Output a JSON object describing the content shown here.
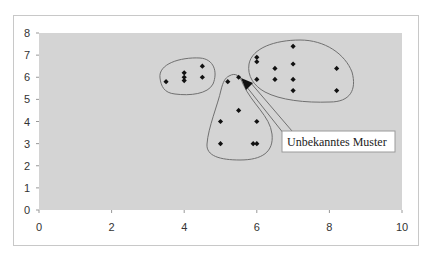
{
  "chart_data": {
    "type": "scatter",
    "title": "",
    "xlabel": "",
    "ylabel": "",
    "xlim": [
      0,
      10
    ],
    "ylim": [
      0,
      8
    ],
    "x_ticks": [
      0,
      2,
      4,
      6,
      8,
      10
    ],
    "y_ticks": [
      0,
      1,
      2,
      3,
      4,
      5,
      6,
      7,
      8
    ],
    "grid": false,
    "legend": null,
    "plot_background": "#d4d4d4",
    "marker": "diamond",
    "marker_color": "#111111",
    "series": [
      {
        "name": "Cluster left",
        "points": [
          [
            3.5,
            5.8
          ],
          [
            4.0,
            6.2
          ],
          [
            4.0,
            6.0
          ],
          [
            4.0,
            5.85
          ],
          [
            4.5,
            6.5
          ],
          [
            4.5,
            6.0
          ]
        ]
      },
      {
        "name": "Cluster middle",
        "points": [
          [
            5.2,
            5.8
          ],
          [
            5.5,
            6.0
          ],
          [
            5.5,
            4.5
          ],
          [
            5.0,
            4.0
          ],
          [
            6.0,
            4.0
          ],
          [
            5.0,
            3.0
          ],
          [
            5.9,
            3.0
          ],
          [
            6.0,
            3.0
          ]
        ]
      },
      {
        "name": "Cluster right",
        "points": [
          [
            6.0,
            6.9
          ],
          [
            6.0,
            6.7
          ],
          [
            7.0,
            7.4
          ],
          [
            6.5,
            6.4
          ],
          [
            7.0,
            6.6
          ],
          [
            8.2,
            6.4
          ],
          [
            6.0,
            5.9
          ],
          [
            6.5,
            5.9
          ],
          [
            7.0,
            5.9
          ],
          [
            7.0,
            5.4
          ],
          [
            8.2,
            5.4
          ]
        ]
      }
    ],
    "annotations": [
      {
        "text": "Unbekanntes Muster",
        "arrow_to": [
          5.55,
          5.9
        ]
      }
    ]
  },
  "callout": {
    "label": "Unbekanntes Muster"
  },
  "axes": {
    "x_labels": [
      "0",
      "2",
      "4",
      "6",
      "8",
      "10"
    ],
    "y_labels": [
      "0",
      "1",
      "2",
      "3",
      "4",
      "5",
      "6",
      "7",
      "8"
    ]
  }
}
